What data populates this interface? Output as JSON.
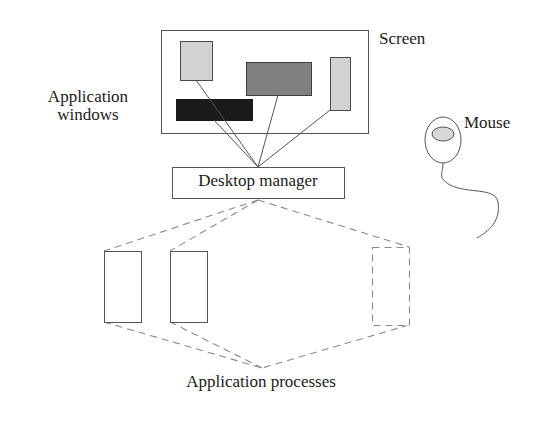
{
  "diagram": {
    "labels": {
      "screen": "Screen",
      "application_windows": "Application\nwindows",
      "mouse": "Mouse",
      "desktop_manager": "Desktop manager",
      "application_processes": "Application processes"
    },
    "colors": {
      "stroke": "#555555",
      "box_stroke": "#4a4a4a",
      "text": "#1b1b1b",
      "window_light": "#d2d2d2",
      "window_medium": "#808080",
      "window_dark": "#1a1a1a",
      "background": "#ffffff",
      "dashed": "#8a8a8a"
    },
    "screen": {
      "name": "screen-frame",
      "x": 161,
      "y": 30,
      "width": 207,
      "height": 103,
      "fill": "none"
    },
    "windows": [
      {
        "name": "window-light-square",
        "x": 180,
        "y": 41,
        "width": 32,
        "height": 39,
        "shade": "light"
      },
      {
        "name": "window-medium-wide",
        "x": 246,
        "y": 62,
        "width": 65,
        "height": 33,
        "shade": "medium"
      },
      {
        "name": "window-light-tall",
        "x": 330,
        "y": 57,
        "width": 20,
        "height": 53,
        "shade": "light"
      },
      {
        "name": "window-dark-wide",
        "x": 176,
        "y": 99,
        "width": 76,
        "height": 21,
        "shade": "dark"
      }
    ],
    "connectors_to_manager": [
      {
        "name": "connector-window-light-square",
        "x1": 196,
        "y1": 80,
        "x2": 258,
        "y2": 167
      },
      {
        "name": "connector-window-dark-wide",
        "x1": 214,
        "y1": 120,
        "x2": 258,
        "y2": 167
      },
      {
        "name": "connector-window-medium-wide",
        "x1": 278,
        "y1": 95,
        "x2": 258,
        "y2": 167
      },
      {
        "name": "connector-window-light-tall",
        "x1": 330,
        "y1": 110,
        "x2": 258,
        "y2": 167
      }
    ],
    "desktop_manager_box": {
      "name": "desktop-manager-box",
      "x": 172,
      "y": 167,
      "width": 172,
      "height": 31
    },
    "processes": [
      {
        "name": "process-box-1",
        "x": 104,
        "y": 251,
        "width": 37,
        "height": 71,
        "style": "solid"
      },
      {
        "name": "process-box-2",
        "x": 170,
        "y": 251,
        "width": 37,
        "height": 71,
        "style": "solid"
      },
      {
        "name": "process-box-3",
        "x": 372,
        "y": 247,
        "width": 37,
        "height": 78,
        "style": "dashed"
      }
    ],
    "process_connectors": [
      {
        "name": "dashed-top-to-process-1",
        "x1": 258,
        "y1": 200,
        "x2": 104,
        "y2": 251
      },
      {
        "name": "dashed-top-to-process-2",
        "x1": 258,
        "y1": 200,
        "x2": 170,
        "y2": 251
      },
      {
        "name": "dashed-top-to-process-3",
        "x1": 258,
        "y1": 200,
        "x2": 409,
        "y2": 247
      },
      {
        "name": "dashed-bottom-from-process-1",
        "x1": 104,
        "y1": 322,
        "x2": 262,
        "y2": 368
      },
      {
        "name": "dashed-bottom-from-process-2",
        "x1": 170,
        "y1": 322,
        "x2": 262,
        "y2": 368
      },
      {
        "name": "dashed-bottom-from-process-3",
        "x1": 409,
        "y1": 325,
        "x2": 262,
        "y2": 368
      }
    ],
    "mouse": {
      "name": "mouse-graphic",
      "body": {
        "cx": 443,
        "cy": 140,
        "rx": 18,
        "ry": 23
      },
      "button": {
        "cx": 443,
        "cy": 134,
        "rx": 11,
        "ry": 7
      },
      "cord": "M 443 163 C 443 175, 438 178, 452 186 C 470 195, 496 188, 498 203 C 501 222, 490 232, 478 238"
    }
  }
}
